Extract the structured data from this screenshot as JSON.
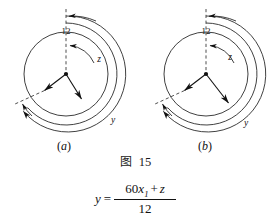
{
  "figure": {
    "caption_label": "图",
    "caption_number": "15",
    "panels": [
      {
        "id": "a",
        "sub_label_open": "(",
        "sub_label_letter": "a",
        "sub_label_close": ")",
        "clock_top_label": "12",
        "arc_inner_label": "z",
        "arc_outer_label": "y",
        "center_x": 66,
        "center_y": 74,
        "face_radius": 42,
        "mid_arc_radius": 51,
        "outer_arc_radius": 58,
        "hour_hand_angle_deg": 216,
        "hour_hand_length": 28,
        "minute_hand_angle_deg": 152,
        "minute_hand_length": 33
      },
      {
        "id": "b",
        "sub_label_open": "(",
        "sub_label_letter": "b",
        "sub_label_close": ")",
        "clock_top_label": "12",
        "arc_inner_label": "z",
        "arc_outer_label": "y",
        "center_x": 206,
        "center_y": 74,
        "face_radius": 42,
        "mid_arc_radius": 51,
        "outer_arc_radius": 58,
        "hour_hand_angle_deg": 216,
        "hour_hand_length": 28,
        "minute_hand_angle_deg": 143,
        "minute_hand_length": 38
      }
    ],
    "formula": {
      "lhs": "y",
      "equals": "=",
      "numerator_coefficient": "60",
      "numerator_variable": "x",
      "numerator_subscript": "1",
      "numerator_operator": "+",
      "numerator_term2": "z",
      "denominator": "12"
    },
    "colors": {
      "ink": "#111111",
      "line": "#2b2b2b",
      "background": "#ffffff"
    }
  }
}
